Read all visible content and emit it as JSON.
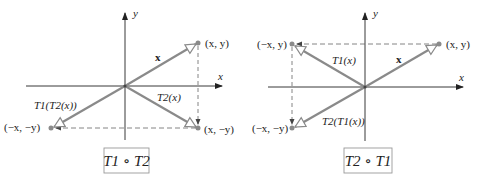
{
  "colors": {
    "axis": "#222222",
    "vector": "#8a8a8a",
    "dashed": "#666666",
    "point": "#8a8a8a",
    "box_border": "#999999"
  },
  "panels": [
    {
      "caption": "T1 ∘ T2",
      "axis_labels": {
        "x": "x",
        "y": "y"
      },
      "points": [
        {
          "label": "(x, y)"
        },
        {
          "label": "(x, −y)"
        },
        {
          "label": "(−x, −y)"
        }
      ],
      "vectors": [
        {
          "label": "x"
        },
        {
          "label": "T2(x)"
        },
        {
          "label": "T1(T2(x))"
        }
      ]
    },
    {
      "caption": "T2 ∘ T1",
      "axis_labels": {
        "x": "x",
        "y": "y"
      },
      "points": [
        {
          "label": "(x, y)"
        },
        {
          "label": "(−x, y)"
        },
        {
          "label": "(−x, −y)"
        }
      ],
      "vectors": [
        {
          "label": "x"
        },
        {
          "label": "T1(x)"
        },
        {
          "label": "T2(T1(x))"
        }
      ]
    }
  ]
}
